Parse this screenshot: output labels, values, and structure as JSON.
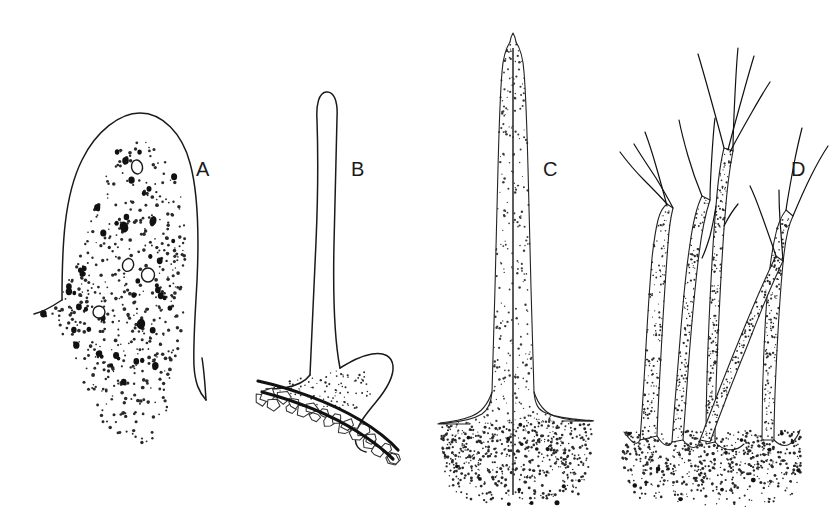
{
  "plate": {
    "title": "Trichome and spine types plate",
    "description": "Four line-drawn botanical sections labelled A to D showing a dome-shaped papilla, a stalked spine on a cell layer, a simple tapering bristle, and a branched stellate trichome.",
    "background_color": "#ffffff",
    "ink_color": "#1a1a1a",
    "width": 833,
    "height": 526
  },
  "labels": [
    {
      "id": "A",
      "text": "A",
      "x": 196,
      "y": 176
    },
    {
      "id": "B",
      "text": "B",
      "x": 351,
      "y": 176
    },
    {
      "id": "C",
      "text": "C",
      "x": 543,
      "y": 176
    },
    {
      "id": "D",
      "text": "D",
      "x": 791,
      "y": 176
    }
  ],
  "figures": [
    {
      "id": "A",
      "name": "dome-papilla",
      "caption_letter": "A",
      "outline_path": "M 62 300 C 62 246 64 196 82 160 C 96 131 120 113 140 113 C 162 113 182 133 190 163 C 198 192 199 238 197 281 C 195 318 193 344 194 366 C 195 383 199 392 206 400",
      "outline_path_b": "M 62 300 C 50 308 42 312 34 314",
      "outline_path_c": "M 206 400 C 205 384 204 370 202 358",
      "stipple_polygon": [
        [
          128,
          139
        ],
        [
          152,
          143
        ],
        [
          168,
          158
        ],
        [
          178,
          182
        ],
        [
          184,
          214
        ],
        [
          186,
          252
        ],
        [
          186,
          292
        ],
        [
          183,
          330
        ],
        [
          178,
          360
        ],
        [
          172,
          392
        ],
        [
          166,
          420
        ],
        [
          158,
          440
        ],
        [
          140,
          446
        ],
        [
          120,
          440
        ],
        [
          104,
          424
        ],
        [
          92,
          400
        ],
        [
          80,
          376
        ],
        [
          68,
          352
        ],
        [
          58,
          332
        ],
        [
          48,
          318
        ],
        [
          40,
          316
        ],
        [
          48,
          304
        ],
        [
          62,
          292
        ],
        [
          76,
          268
        ],
        [
          86,
          238
        ],
        [
          96,
          204
        ],
        [
          108,
          170
        ],
        [
          118,
          150
        ]
      ],
      "stipple_count": 520,
      "stipple_r": [
        0.7,
        1.9
      ],
      "blob_count": 46,
      "blob_r": [
        1.8,
        3.4
      ],
      "vesicles": [
        {
          "cx": 137,
          "cy": 167,
          "rx": 5.5,
          "ry": 7.0,
          "rot": -12
        },
        {
          "cx": 128,
          "cy": 265,
          "rx": 5.5,
          "ry": 6.5,
          "rot": 22
        },
        {
          "cx": 148,
          "cy": 275,
          "rx": 6.5,
          "ry": 7.0,
          "rot": 0
        },
        {
          "cx": 99,
          "cy": 312,
          "rx": 6.0,
          "ry": 6.0,
          "rot": 0
        }
      ],
      "dark_granules": [
        {
          "cx": 124,
          "cy": 227,
          "rx": 4.2,
          "ry": 5.6,
          "rot": -18
        },
        {
          "cx": 153,
          "cy": 221,
          "rx": 3.4,
          "ry": 5.0,
          "rot": 16
        },
        {
          "cx": 141,
          "cy": 324,
          "rx": 4.2,
          "ry": 5.2,
          "rot": 8
        }
      ]
    },
    {
      "id": "B",
      "name": "stalked-spine-on-cell-layer",
      "caption_letter": "B",
      "shaft_path": "M 310 375 C 312 336 314 290 316 242 C 318 196 318 150 317 120 C 316 104 319 93 326 92 C 334 91 338 101 337 118 C 336 150 335 196 334 244 C 333 292 334 338 340 368",
      "foot_left_path": "M 310 375 C 305 382 296 386 284 388 C 276 389 270 389 266 389",
      "foot_right_path": "M 340 368 C 350 362 360 356 372 354 C 384 352 392 356 393 366 C 394 378 386 390 376 402 C 366 414 358 424 356 434 C 354 444 358 450 366 452",
      "arc_outer_path": "M 258 381 C 290 388 330 402 360 420 C 378 431 390 441 398 450",
      "arc_inner_path": "M 262 392 C 292 400 330 414 358 432 C 374 442 386 452 393 459",
      "cell_count": 22,
      "shaft_fill": "#ffffff",
      "stipple_patch_count": 90
    },
    {
      "id": "C",
      "name": "simple-tapering-bristle",
      "caption_letter": "C",
      "left_path": "M 510 42 C 506 48 503 58 502 72 C 500 96 499 130 498 168 C 497 206 496 248 495 288 C 494 326 493 360 492 392 C 491 404 488 410 482 414 C 472 420 458 422 446 423 C 436 424 428 424 470 424",
      "right_path": "M 516 42 C 520 48 523 58 524 72 C 526 96 527 130 528 168 C 529 206 530 248 531 288 C 532 326 533 360 534 392 C 535 404 538 410 546 413 C 556 417 570 419 584 420 C 596 421 604 421 562 421",
      "tip_path": "M 510 42 C 511 36 513 33 513 33 C 513 33 515 36 516 42",
      "base_left_path": "M 492 392 C 488 404 482 412 472 416 C 462 420 450 422 440 423",
      "base_right_path": "M 534 392 C 538 404 544 412 554 416 C 566 420 580 421 592 421",
      "midline_path": "M 513 48 L 513 495",
      "shaft_stipple_count": 300,
      "base_polygon": [
        [
          440,
          424
        ],
        [
          592,
          422
        ],
        [
          590,
          460
        ],
        [
          586,
          486
        ],
        [
          578,
          498
        ],
        [
          556,
          503
        ],
        [
          520,
          505
        ],
        [
          486,
          503
        ],
        [
          460,
          498
        ],
        [
          448,
          486
        ],
        [
          442,
          460
        ]
      ],
      "base_stipple_count": 680,
      "base_blob_count": 14
    },
    {
      "id": "D",
      "name": "branched-stellate-trichome",
      "caption_letter": "D",
      "base_polygon": [
        [
          624,
          432
        ],
        [
          800,
          430
        ],
        [
          802,
          468
        ],
        [
          796,
          492
        ],
        [
          782,
          502
        ],
        [
          750,
          507
        ],
        [
          706,
          508
        ],
        [
          668,
          505
        ],
        [
          640,
          498
        ],
        [
          626,
          484
        ],
        [
          622,
          456
        ]
      ],
      "base_stipple_count": 700,
      "base_blob_count": 16,
      "stems": [
        {
          "name": "stem-left",
          "outline": "M 640 440 C 642 414 644 382 646 346 C 648 310 650 282 652 258 C 654 240 656 228 658 220 C 660 212 663 207 667 204 L 673 208 C 671 216 669 228 668 244 C 666 270 664 300 662 336 C 660 372 658 406 657 436 Z",
          "stipple": 150
        },
        {
          "name": "stem-second",
          "outline": "M 672 442 C 674 412 677 378 680 340 C 683 302 686 270 690 244 C 693 222 697 206 702 196 L 710 200 C 706 212 702 230 699 254 C 695 286 692 320 689 358 C 686 396 684 424 683 440 Z",
          "stipple": 140
        },
        {
          "name": "stem-middle",
          "outline": "M 706 444 C 706 408 707 366 709 322 C 711 278 713 238 716 206 C 718 180 721 160 724 148 L 733 151 C 730 166 727 188 725 216 C 722 252 720 294 718 338 C 716 382 715 418 715 442 Z",
          "stipple": 170
        },
        {
          "name": "stem-right",
          "outline": "M 762 440 C 762 404 763 366 765 328 C 767 290 770 262 774 242 C 777 226 781 216 786 210 L 793 216 C 789 224 786 236 784 254 C 781 280 779 312 777 350 C 775 388 774 418 774 440 Z",
          "stipple": 150
        },
        {
          "name": "stem-crossing",
          "outline": "M 700 440 C 712 408 726 372 740 338 C 754 304 766 276 776 256 L 783 261 C 773 282 761 310 748 344 C 734 378 720 414 710 442 Z",
          "stipple": 120
        }
      ],
      "branch_tips": [
        "M 667 204 C 660 196 652 188 644 180 C 634 170 626 160 620 152",
        "M 673 208 C 668 198 662 188 656 178 C 648 166 640 154 634 144",
        "M 667 206 C 664 194 660 180 656 166 C 652 152 648 140 645 132",
        "M 702 196 C 697 184 692 170 688 156 C 684 142 681 130 679 120",
        "M 710 200 C 710 186 711 170 712 154 C 713 138 714 126 715 118",
        "M 724 148 C 720 132 715 114 710 96 C 705 78 701 64 698 54",
        "M 733 151 C 733 134 734 114 735 94 C 736 74 737 58 738 48",
        "M 728 150 C 732 134 737 116 742 98 C 747 80 751 66 754 56",
        "M 730 152 C 736 140 744 126 752 112 C 760 98 766 88 770 82",
        "M 786 210 C 788 196 791 180 794 164 C 797 148 800 136 802 128",
        "M 793 216 C 798 204 804 190 811 176 C 818 162 824 152 828 146",
        "M 776 256 C 772 244 767 230 762 216 C 757 202 753 192 750 186",
        "M 783 261 C 782 248 781 234 780 220 C 779 206 779 196 779 190",
        "M 716 206 C 714 218 712 228 710 236 C 707 246 704 254 702 258",
        "M 724 226 C 728 218 733 210 738 204"
      ],
      "notch_paths": [
        "M 624 432 C 630 440 636 448 640 440",
        "M 657 436 C 663 446 669 448 672 442",
        "M 683 440 C 690 450 698 450 700 440",
        "M 715 442 C 724 452 736 452 744 444",
        "M 774 440 C 784 450 794 446 800 430"
      ]
    }
  ]
}
